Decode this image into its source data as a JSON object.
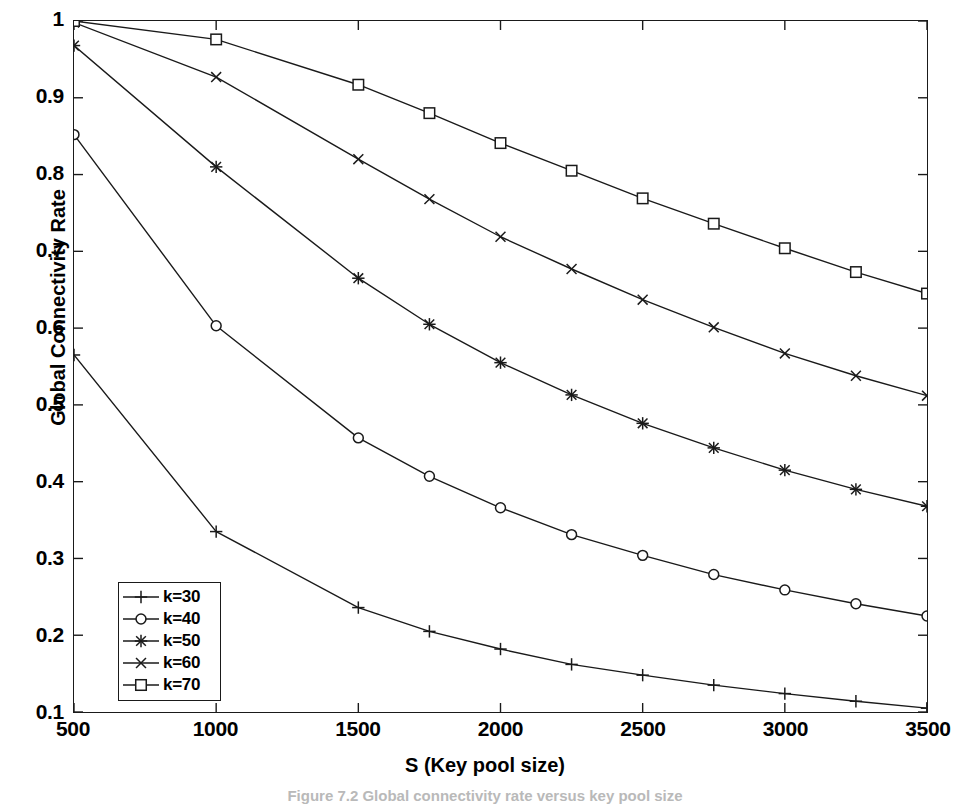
{
  "figure": {
    "caption": "Figure 7.2   Global connectivity rate versus key pool size",
    "background_color": "#ffffff",
    "line_color": "#1a1a1a"
  },
  "chart_data": {
    "type": "line",
    "title": "",
    "xlabel": "S (Key pool size)",
    "ylabel": "Global Connectivity Rate",
    "xlim": [
      500,
      3500
    ],
    "ylim": [
      0.1,
      1.0
    ],
    "xticks": [
      500,
      1000,
      1500,
      2000,
      2500,
      3000,
      3500
    ],
    "xtick_labels": [
      "500",
      "1000",
      "1500",
      "2000",
      "2500",
      "3000",
      "3500"
    ],
    "yticks": [
      0.1,
      0.2,
      0.3,
      0.4,
      0.5,
      0.6,
      0.7,
      0.8,
      0.9,
      1.0
    ],
    "ytick_labels": [
      "0.1",
      "0.2",
      "0.3",
      "0.4",
      "0.5",
      "0.6",
      "0.7",
      "0.8",
      "0.9",
      "1"
    ],
    "grid": false,
    "legend_position": "lower left",
    "x": [
      500,
      1000,
      1500,
      1750,
      2000,
      2250,
      2500,
      2750,
      3000,
      3250,
      3500
    ],
    "series": [
      {
        "name": "k=30",
        "marker": "plus",
        "values": [
          0.565,
          0.335,
          0.236,
          0.205,
          0.182,
          0.162,
          0.148,
          0.135,
          0.124,
          0.114,
          0.105
        ]
      },
      {
        "name": "k=40",
        "marker": "circle",
        "values": [
          0.852,
          0.603,
          0.457,
          0.407,
          0.366,
          0.331,
          0.304,
          0.279,
          0.259,
          0.241,
          0.225
        ]
      },
      {
        "name": "k=50",
        "marker": "asterisk",
        "values": [
          0.968,
          0.81,
          0.665,
          0.605,
          0.555,
          0.513,
          0.476,
          0.444,
          0.415,
          0.39,
          0.368
        ]
      },
      {
        "name": "k=60",
        "marker": "cross",
        "values": [
          0.998,
          0.927,
          0.82,
          0.768,
          0.719,
          0.677,
          0.637,
          0.601,
          0.567,
          0.538,
          0.512
        ]
      },
      {
        "name": "k=70",
        "marker": "square",
        "values": [
          1.0,
          0.976,
          0.917,
          0.88,
          0.841,
          0.805,
          0.769,
          0.736,
          0.704,
          0.673,
          0.645
        ]
      }
    ]
  }
}
